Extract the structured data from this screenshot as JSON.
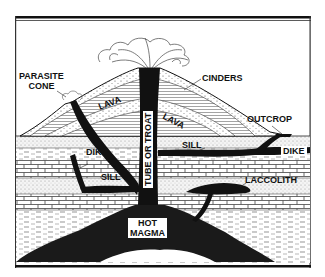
{
  "diagram": {
    "labels": {
      "parasite_cone": "PARASITE\nCONE",
      "parasite_line1": "PARASITE",
      "parasite_line2": "CONE",
      "cinders": "CINDERS",
      "lava_upper": "LAVA",
      "lava_lower": "LAVA",
      "tube": "TUBE OR TROAT",
      "outcrop": "OUTCROP",
      "dike_left": "DIKE",
      "dike_right": "DIKE",
      "sill_upper": "SILL",
      "sill_lower": "SILL",
      "laccolith": "LACCOLITH",
      "magma_line1": "HOT",
      "magma_line2": "MAGMA"
    },
    "colors": {
      "ink": "#111111",
      "paper": "#ffffff",
      "stipple": "#9a9a9a"
    }
  }
}
